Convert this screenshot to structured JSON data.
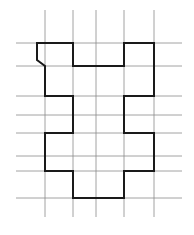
{
  "diagram": {
    "type": "grid-shape-outline",
    "colors": {
      "background": "#ffffff",
      "grid": "#8c8c8c",
      "outline": "#1a1a1a"
    },
    "grid": {
      "vertical_x": [
        45,
        73,
        96,
        124,
        154
      ],
      "vertical_span": [
        10,
        217
      ],
      "horizontal_y": [
        43,
        66,
        96,
        115,
        133,
        156,
        171,
        198
      ],
      "horizontal_span": [
        16,
        182
      ]
    },
    "outline": {
      "points": [
        [
          37,
          43
        ],
        [
          73,
          43
        ],
        [
          73,
          66
        ],
        [
          124,
          66
        ],
        [
          124,
          43
        ],
        [
          154,
          43
        ],
        [
          154,
          96
        ],
        [
          124,
          96
        ],
        [
          124,
          133
        ],
        [
          154,
          133
        ],
        [
          154,
          171
        ],
        [
          124,
          171
        ],
        [
          124,
          198
        ],
        [
          73,
          198
        ],
        [
          73,
          171
        ],
        [
          45,
          171
        ],
        [
          45,
          133
        ],
        [
          73,
          133
        ],
        [
          73,
          96
        ],
        [
          45,
          96
        ],
        [
          45,
          66
        ],
        [
          37,
          60
        ]
      ]
    }
  }
}
